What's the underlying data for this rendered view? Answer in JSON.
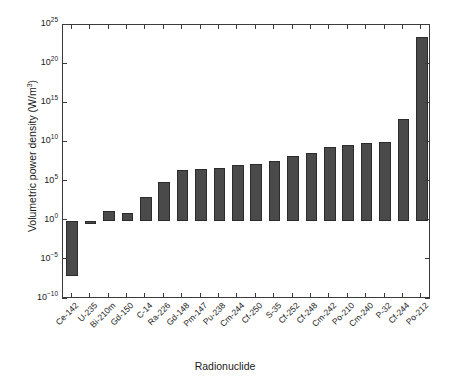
{
  "chart_data": {
    "type": "bar",
    "title": "",
    "xlabel": "Radionuclide",
    "ylabel": "Volumetric power density (W/m3)",
    "ylabel_base": "Volumetric power density (W/m",
    "ylabel_sup": "3",
    "ylabel_tail": ")",
    "yscale": "log",
    "ylim": [
      1e-10,
      1e+25
    ],
    "baseline": 1,
    "grid": false,
    "legend": null,
    "ytick_labels": [
      "10-10",
      "10-5",
      "100",
      "105",
      "1010",
      "1015",
      "1020",
      "1025"
    ],
    "yticks": [
      {
        "mantissa": "10",
        "exponent": "25",
        "value": 1e+25
      },
      {
        "mantissa": "10",
        "exponent": "20",
        "value": 1e+20
      },
      {
        "mantissa": "10",
        "exponent": "15",
        "value": 1000000000000000.0
      },
      {
        "mantissa": "10",
        "exponent": "10",
        "value": 10000000000.0
      },
      {
        "mantissa": "10",
        "exponent": "5",
        "value": 100000
      },
      {
        "mantissa": "10",
        "exponent": "0",
        "value": 1
      },
      {
        "mantissa": "10",
        "exponent": "−5",
        "value": 1e-05
      },
      {
        "mantissa": "10",
        "exponent": "−10",
        "value": 1e-10
      }
    ],
    "categories": [
      "Ce-142",
      "U-235",
      "Bi-210m",
      "Gd-150",
      "C-14",
      "Ra-226",
      "Gd-148",
      "Pm-147",
      "Pu-238",
      "Cm-244",
      "Cf-250",
      "S-35",
      "Cf-252",
      "Cf-248",
      "Cm-242",
      "Po-210",
      "Cm-240",
      "P-32",
      "Cf-244",
      "Po-212"
    ],
    "values": [
      1e-07,
      0.4,
      20,
      10,
      1000,
      100000.0,
      3000000.0,
      4000000.0,
      6000000.0,
      12000000.0,
      20000000.0,
      40000000.0,
      200000000.0,
      500000000.0,
      3000000000.0,
      5000000000.0,
      8000000000.0,
      10000000000.0,
      10000000000000.0,
      3e+23
    ],
    "bar_color": "#4a4a4a",
    "bar_edge_color": "#2b2b2b",
    "axis_color": "#3a3a3a"
  }
}
